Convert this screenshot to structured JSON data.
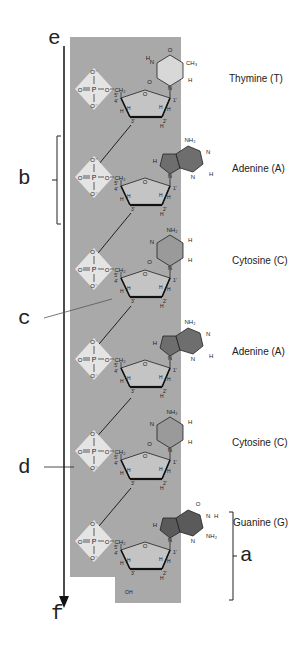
{
  "labels": {
    "a": "a",
    "b": "b",
    "c": "c",
    "d": "d",
    "e": "e",
    "f": "f"
  },
  "bases": [
    {
      "name": "Thymine (T)",
      "type": "pyrimidine",
      "fill": "#d8d8d8"
    },
    {
      "name": "Adenine (A)",
      "type": "purine",
      "fill": "#6e6e6e"
    },
    {
      "name": "Cytosine (C)",
      "type": "pyrimidine",
      "fill": "#9a9a9a"
    },
    {
      "name": "Adenine (A)",
      "type": "purine",
      "fill": "#6e6e6e"
    },
    {
      "name": "Cytosine (C)",
      "type": "pyrimidine",
      "fill": "#9a9a9a"
    },
    {
      "name": "Guanine (G)",
      "type": "purine",
      "fill": "#5a5a5a"
    }
  ],
  "phosphate": {
    "top": "O⁻",
    "left": "O",
    "center": "P",
    "right": "O",
    "bottom": "O⁻",
    "group": "CH₂"
  },
  "sugar_atoms": {
    "c1": "1'",
    "c2": "2'",
    "c3": "3'",
    "c4": "4'",
    "c5": "5'",
    "o": "O",
    "h": "H",
    "oh": "OH"
  },
  "substituents": {
    "ch3": "CH₃",
    "nh2": "NH₂",
    "o": "O",
    "n": "N",
    "h": "H"
  },
  "colors": {
    "backbone_band": "#a9a9a9",
    "phosphate_diamond": "#e4e4e4",
    "sugar_ring": "#c4c4c4",
    "line": "#111111"
  }
}
